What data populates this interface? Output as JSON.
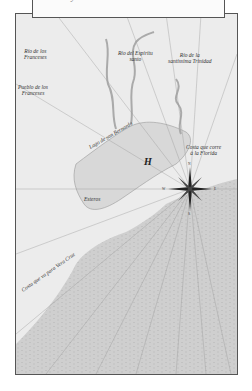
{
  "caption": {
    "text": "...ido y Río Grande — 1685"
  },
  "map": {
    "labels": {
      "rio_franceses": "Río de los\nFranceses",
      "rio_espiritu": "Río del Espíritu\nsanto",
      "rio_trinidad": "Río de la\nsantíssima Trinidad",
      "pueblo_franceses": "Pueblo de los\nFranceses",
      "lago": "Lago de san Bernardo",
      "marker_h": "H",
      "costa_florida": "Costa que corre\nà la Florida",
      "esteros": "Esteros",
      "costa_vera_cruz": "Costa que va para Vera Cruz"
    },
    "compass": {
      "n": "N",
      "s": "S",
      "e": "E",
      "w": "W"
    },
    "colors": {
      "land": "#ececec",
      "water": "#cfcfcf",
      "lines": "#888888",
      "border": "#555555"
    }
  }
}
